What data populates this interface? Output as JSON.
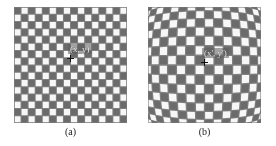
{
  "figure": {
    "background_color": "#ffffff",
    "dark_color": "#6b6b6b",
    "light_color": "#f7f7f7",
    "grout_color": "#808080",
    "panels": [
      {
        "id": "a",
        "caption": "(a)",
        "point_label": "(x, y)",
        "marker": "crosshair-icon",
        "distortion": "none",
        "rows": 16,
        "cols": 16,
        "x": 14,
        "y": 7,
        "width": 113,
        "height": 116
      },
      {
        "id": "b",
        "caption": "(b)",
        "point_label": "(x', y')",
        "marker": "crosshair-icon",
        "distortion": "barrel",
        "rows": 16,
        "cols": 16,
        "x": 148,
        "y": 7,
        "width": 113,
        "height": 116
      }
    ]
  },
  "chart_data": {
    "type": "heatmap",
    "title": "",
    "subtitle": "",
    "xlabel": "",
    "ylabel": "",
    "legend": [],
    "annotations": [
      {
        "panel": "a",
        "text": "(x, y)",
        "x_px": 66,
        "y_px": 47
      },
      {
        "panel": "b",
        "text": "(x', y')",
        "x_px": 200,
        "y_px": 46
      },
      {
        "panel": "a",
        "text": "(a)",
        "x_px": 66,
        "y_px": 130
      },
      {
        "panel": "b",
        "text": "(b)",
        "x_px": 200,
        "y_px": 130
      }
    ],
    "panels": [
      {
        "name": "(a)",
        "description": "Ideal undistorted checkerboard calibration pattern",
        "grid_rows": 16,
        "grid_cols": 16,
        "cell_size_px": 7.0,
        "distortion_k1": 0.0,
        "marked_point": {
          "label": "(x, y)",
          "x_px": 70,
          "y_px": 58
        }
      },
      {
        "name": "(b)",
        "description": "Lens-distorted checkerboard calibration pattern (barrel distortion)",
        "grid_rows": 16,
        "grid_cols": 16,
        "cell_size_px": 7.0,
        "distortion_k1": -0.26,
        "marked_point": {
          "label": "(x', y')",
          "x_px": 204,
          "y_px": 62
        }
      }
    ]
  }
}
